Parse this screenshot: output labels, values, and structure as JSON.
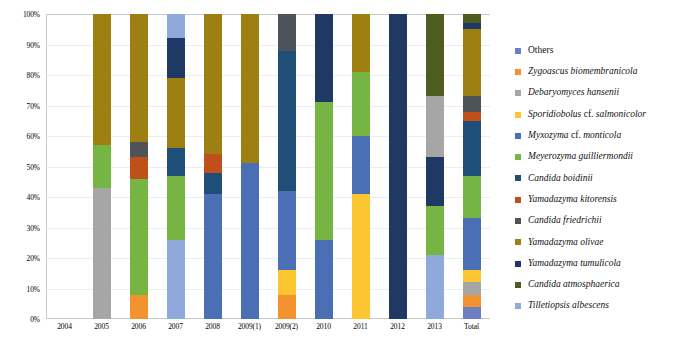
{
  "chart_data": {
    "type": "bar",
    "subtype": "stacked-percentage",
    "title": "",
    "xlabel": "",
    "ylabel": "",
    "ylim": [
      0,
      100
    ],
    "yunit": "%",
    "grid": true,
    "legend_position": "right",
    "categories": [
      "2004",
      "2005",
      "2006",
      "2007",
      "2008",
      "2009(1)",
      "2009(2)",
      "2010",
      "2011",
      "2012",
      "2013",
      "Total"
    ],
    "ytick_labels": [
      "0%",
      "10%",
      "20%",
      "30%",
      "40%",
      "50%",
      "60%",
      "70%",
      "80%",
      "90%",
      "100%"
    ],
    "ytick_values": [
      0,
      10,
      20,
      30,
      40,
      50,
      60,
      70,
      80,
      90,
      100
    ],
    "series": [
      {
        "name": "Tilletiopsis albescens",
        "color": "#8fa9dc",
        "values": [
          0,
          0,
          0,
          26,
          0,
          0,
          0,
          0,
          0,
          0,
          21,
          5
        ]
      },
      {
        "name": "Candida atmosphaerica",
        "color": "#4d5c1f",
        "values": [
          0,
          0,
          0,
          0,
          0,
          0,
          0,
          0,
          0,
          0,
          0,
          0
        ]
      },
      {
        "name": "Yamadazyma tumulicola",
        "color": "#1f3864",
        "values": [
          0,
          0,
          0,
          0,
          0,
          0,
          0,
          0,
          0,
          0,
          0,
          0
        ]
      },
      {
        "name": "Yamadazyma olivae",
        "color": "#9e8012",
        "values": [
          0,
          0,
          0,
          0,
          0,
          0,
          0,
          0,
          0,
          0,
          0,
          0
        ]
      },
      {
        "name": "Candida friedrichii",
        "color": "#4d5358",
        "values": [
          0,
          0,
          0,
          0,
          0,
          0,
          0,
          0,
          0,
          0,
          0,
          0
        ]
      },
      {
        "name": "Yamadazyma kitorensis",
        "color": "#c0501a",
        "values": [
          0,
          0,
          0,
          0,
          0,
          0,
          0,
          0,
          0,
          0,
          0,
          0
        ]
      },
      {
        "name": "Candida boidinii",
        "color": "#1f4e79",
        "values": [
          0,
          0,
          0,
          0,
          0,
          0,
          0,
          0,
          0,
          0,
          0,
          0
        ]
      },
      {
        "name": "Meyerozyma guilliermondii",
        "color": "#76b443",
        "values": [
          0,
          14,
          46,
          21,
          0,
          0,
          0,
          45,
          16,
          0,
          16,
          14
        ]
      },
      {
        "name": "Myxozyma cf. monticola",
        "color": "#4a6fb5",
        "values": [
          0,
          0,
          0,
          0,
          41,
          51,
          26,
          26,
          14,
          0,
          0,
          17
        ]
      },
      {
        "name": "Sporidiobolus cf. salmonicolor",
        "color": "#fcc631",
        "values": [
          0,
          0,
          0,
          0,
          0,
          0,
          8,
          0,
          41,
          0,
          0,
          4
        ]
      },
      {
        "name": "Debaryomyces hansenii",
        "color": "#a6a6a6",
        "values": [
          0,
          43,
          0,
          0,
          0,
          0,
          0,
          0,
          0,
          0,
          0,
          4
        ]
      },
      {
        "name": "Zygoascus biomembranicola",
        "color": "#f2932f",
        "values": [
          0,
          0,
          8,
          0,
          0,
          0,
          8,
          0,
          0,
          0,
          0,
          4
        ]
      },
      {
        "name": "Others",
        "color": "#6b7fc0",
        "values": [
          0,
          0,
          0,
          0,
          0,
          0,
          0,
          0,
          0,
          0,
          0,
          0
        ]
      }
    ],
    "stacks": [
      {
        "category": "2004",
        "total_pct": 0,
        "segments": []
      },
      {
        "category": "2005",
        "total_pct": 100,
        "segments": [
          {
            "name": "Debaryomyces hansenii",
            "color": "#a6a6a6",
            "start": 0,
            "end": 43
          },
          {
            "name": "Meyerozyma guilliermondii",
            "color": "#76b443",
            "start": 43,
            "end": 57
          },
          {
            "name": "Yamadazyma olivae",
            "color": "#9e8012",
            "start": 57,
            "end": 100
          }
        ]
      },
      {
        "category": "2006",
        "total_pct": 100,
        "segments": [
          {
            "name": "Zygoascus biomembranicola",
            "color": "#f2932f",
            "start": 0,
            "end": 8
          },
          {
            "name": "Meyerozyma guilliermondii",
            "color": "#76b443",
            "start": 8,
            "end": 46
          },
          {
            "name": "Yamadazyma kitorensis",
            "color": "#c0501a",
            "start": 46,
            "end": 53
          },
          {
            "name": "Candida friedrichii",
            "color": "#4d5358",
            "start": 53,
            "end": 58
          },
          {
            "name": "Yamadazyma olivae",
            "color": "#9e8012",
            "start": 58,
            "end": 100
          }
        ]
      },
      {
        "category": "2007",
        "total_pct": 100,
        "segments": [
          {
            "name": "Tilletiopsis albescens",
            "color": "#8fa9dc",
            "start": 0,
            "end": 26
          },
          {
            "name": "Meyerozyma guilliermondii",
            "color": "#76b443",
            "start": 26,
            "end": 47
          },
          {
            "name": "Candida boidinii",
            "color": "#1f4e79",
            "start": 47,
            "end": 56
          },
          {
            "name": "Yamadazyma olivae",
            "color": "#9e8012",
            "start": 56,
            "end": 79
          },
          {
            "name": "Yamadazyma tumulicola",
            "color": "#1f3864",
            "start": 79,
            "end": 92
          },
          {
            "name": "Tilletiopsis albescens",
            "color": "#8fa9dc",
            "start": 92,
            "end": 100
          }
        ]
      },
      {
        "category": "2008",
        "total_pct": 100,
        "segments": [
          {
            "name": "Myxozyma cf. monticola",
            "color": "#4a6fb5",
            "start": 0,
            "end": 41
          },
          {
            "name": "Candida boidinii",
            "color": "#1f4e79",
            "start": 41,
            "end": 48
          },
          {
            "name": "Yamadazyma kitorensis",
            "color": "#c0501a",
            "start": 48,
            "end": 54
          },
          {
            "name": "Yamadazyma olivae",
            "color": "#9e8012",
            "start": 54,
            "end": 100
          }
        ]
      },
      {
        "category": "2009(1)",
        "total_pct": 100,
        "segments": [
          {
            "name": "Myxozyma cf. monticola",
            "color": "#4a6fb5",
            "start": 0,
            "end": 51
          },
          {
            "name": "Yamadazyma olivae",
            "color": "#9e8012",
            "start": 51,
            "end": 100
          }
        ]
      },
      {
        "category": "2009(2)",
        "total_pct": 100,
        "segments": [
          {
            "name": "Zygoascus biomembranicola",
            "color": "#f2932f",
            "start": 0,
            "end": 8
          },
          {
            "name": "Sporidiobolus cf. salmonicolor",
            "color": "#fcc631",
            "start": 8,
            "end": 16
          },
          {
            "name": "Myxozyma cf. monticola",
            "color": "#4a6fb5",
            "start": 16,
            "end": 42
          },
          {
            "name": "Candida boidinii",
            "color": "#1f4e79",
            "start": 42,
            "end": 88
          },
          {
            "name": "Candida friedrichii",
            "color": "#4d5358",
            "start": 88,
            "end": 100
          }
        ]
      },
      {
        "category": "2010",
        "total_pct": 100,
        "segments": [
          {
            "name": "Myxozyma cf. monticola",
            "color": "#4a6fb5",
            "start": 0,
            "end": 26
          },
          {
            "name": "Meyerozyma guilliermondii",
            "color": "#76b443",
            "start": 26,
            "end": 71
          },
          {
            "name": "Yamadazyma tumulicola",
            "color": "#1f3864",
            "start": 71,
            "end": 100
          }
        ]
      },
      {
        "category": "2011",
        "total_pct": 100,
        "segments": [
          {
            "name": "Sporidiobolus cf. salmonicolor",
            "color": "#fcc631",
            "start": 0,
            "end": 41
          },
          {
            "name": "Myxozyma cf. monticola",
            "color": "#4a6fb5",
            "start": 41,
            "end": 60
          },
          {
            "name": "Meyerozyma guilliermondii",
            "color": "#76b443",
            "start": 60,
            "end": 81
          },
          {
            "name": "Yamadazyma olivae",
            "color": "#9e8012",
            "start": 81,
            "end": 100
          }
        ]
      },
      {
        "category": "2012",
        "total_pct": 100,
        "segments": [
          {
            "name": "Yamadazyma tumulicola",
            "color": "#1f3864",
            "start": 0,
            "end": 100
          }
        ]
      },
      {
        "category": "2013",
        "total_pct": 100,
        "segments": [
          {
            "name": "Tilletiopsis albescens",
            "color": "#8fa9dc",
            "start": 0,
            "end": 21
          },
          {
            "name": "Meyerozyma guilliermondii",
            "color": "#76b443",
            "start": 21,
            "end": 37
          },
          {
            "name": "Yamadazyma tumulicola",
            "color": "#1f3864",
            "start": 37,
            "end": 53
          },
          {
            "name": "Debaryomyces hansenii",
            "color": "#a6a6a6",
            "start": 53,
            "end": 73
          },
          {
            "name": "Candida atmosphaerica",
            "color": "#4d5c1f",
            "start": 73,
            "end": 100
          }
        ]
      },
      {
        "category": "Total",
        "total_pct": 100,
        "segments": [
          {
            "name": "Others",
            "color": "#6b7fc0",
            "start": 0,
            "end": 4
          },
          {
            "name": "Zygoascus biomembranicola",
            "color": "#f2932f",
            "start": 4,
            "end": 8
          },
          {
            "name": "Debaryomyces hansenii",
            "color": "#a6a6a6",
            "start": 8,
            "end": 12
          },
          {
            "name": "Sporidiobolus cf. salmonicolor",
            "color": "#fcc631",
            "start": 12,
            "end": 16
          },
          {
            "name": "Myxozyma cf. monticola",
            "color": "#4a6fb5",
            "start": 16,
            "end": 33
          },
          {
            "name": "Meyerozyma guilliermondii",
            "color": "#76b443",
            "start": 33,
            "end": 47
          },
          {
            "name": "Candida boidinii",
            "color": "#1f4e79",
            "start": 47,
            "end": 65
          },
          {
            "name": "Yamadazyma kitorensis",
            "color": "#c0501a",
            "start": 65,
            "end": 68
          },
          {
            "name": "Candida friedrichii",
            "color": "#4d5358",
            "start": 68,
            "end": 73
          },
          {
            "name": "Yamadazyma olivae",
            "color": "#9e8012",
            "start": 73,
            "end": 95
          },
          {
            "name": "Yamadazyma tumulicola",
            "color": "#1f3864",
            "start": 95,
            "end": 97
          },
          {
            "name": "Candida atmosphaerica",
            "color": "#4d5c1f",
            "start": 97,
            "end": 100
          }
        ]
      }
    ]
  },
  "legend": {
    "items": [
      {
        "label": "Others",
        "color": "#6b7fc0",
        "italic": false
      },
      {
        "label": "Zygoascus biomembranicola",
        "color": "#f2932f",
        "italic": true
      },
      {
        "label": "Debaryomyces hansenii",
        "color": "#a6a6a6",
        "italic": true
      },
      {
        "label": "Sporidiobolus cf. salmonicolor",
        "color": "#fcc631",
        "italic": true
      },
      {
        "label": "Myxozyma cf. monticola",
        "color": "#4a6fb5",
        "italic": true
      },
      {
        "label": "Meyerozyma guilliermondii",
        "color": "#76b443",
        "italic": true
      },
      {
        "label": "Candida boidinii",
        "color": "#1f4e79",
        "italic": true
      },
      {
        "label": "Yamadazyma kitorensis",
        "color": "#c0501a",
        "italic": true
      },
      {
        "label": "Candida friedrichii",
        "color": "#4d5358",
        "italic": true
      },
      {
        "label": "Yamadazyma olivae",
        "color": "#9e8012",
        "italic": true
      },
      {
        "label": "Yamadazyma tumulicola",
        "color": "#1f3864",
        "italic": true
      },
      {
        "label": "Candida atmosphaerica",
        "color": "#4d5c1f",
        "italic": true
      },
      {
        "label": "Tilletiopsis albescens",
        "color": "#8fa9dc",
        "italic": true
      }
    ]
  },
  "axis_colors": {
    "gridline": "#e8eef5",
    "frame": "#c9c9c9",
    "text": "#000000"
  }
}
